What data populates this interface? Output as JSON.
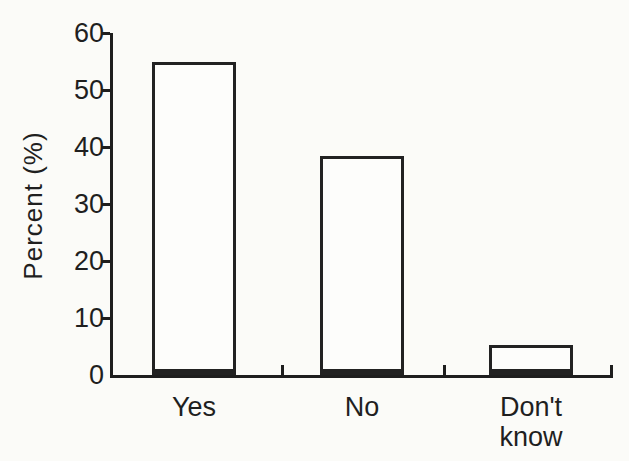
{
  "chart_data": {
    "type": "bar",
    "title": "",
    "categories": [
      "Yes",
      "No",
      "Don't know"
    ],
    "values": [
      55,
      38.5,
      5.3
    ],
    "xlabel": "",
    "ylabel": "Percent (%)",
    "yticks": [
      0,
      10,
      20,
      30,
      40,
      50,
      60
    ],
    "ylim": [
      0,
      60
    ],
    "grid": false,
    "legend": false,
    "bar_fill": "#fdfdfb",
    "bar_border": "#222222",
    "axis_color": "#1e1e1e",
    "text_color": "#1f1f1f",
    "background": "#fbfbf8"
  }
}
